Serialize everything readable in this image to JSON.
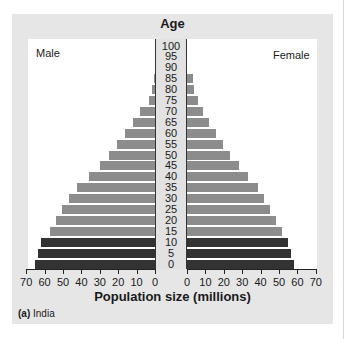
{
  "chart_data": {
    "type": "bar",
    "subtype": "population-pyramid",
    "title": "Age",
    "xlabel": "Population size (millions)",
    "ylabel": "Age",
    "caption_prefix": "(a)",
    "caption": "India",
    "left_label": "Male",
    "right_label": "Female",
    "categories": [
      "0",
      "5",
      "10",
      "15",
      "20",
      "25",
      "30",
      "35",
      "40",
      "45",
      "50",
      "55",
      "60",
      "65",
      "70",
      "75",
      "80",
      "85",
      "90",
      "95",
      "100"
    ],
    "series": [
      {
        "name": "Male",
        "color_dark": "#333333",
        "color_light": "#8c8c8c",
        "values": [
          65,
          63.5,
          62,
          57,
          54,
          50.5,
          47,
          42.5,
          36,
          30,
          25,
          20.5,
          16.5,
          12,
          8,
          3.5,
          1.5,
          0.7,
          0,
          0,
          0
        ]
      },
      {
        "name": "Female",
        "color_dark": "#333333",
        "color_light": "#8c8c8c",
        "values": [
          58,
          56.5,
          55,
          51.5,
          48.5,
          45,
          42,
          38.5,
          33,
          28,
          23.5,
          19.5,
          16,
          12,
          8.5,
          6,
          4,
          3,
          0,
          0,
          0
        ]
      }
    ],
    "dark_age_groups": [
      "0",
      "5",
      "10"
    ],
    "x_ticks": [
      0,
      10,
      20,
      30,
      40,
      50,
      60,
      70
    ],
    "xlim": [
      0,
      70
    ],
    "legend": "none",
    "grid": false
  },
  "labels": {
    "age_title": "Age",
    "male": "Male",
    "female": "Female",
    "xlabel": "Population size (millions)",
    "caption_prefix": "(a)",
    "caption": "India"
  }
}
